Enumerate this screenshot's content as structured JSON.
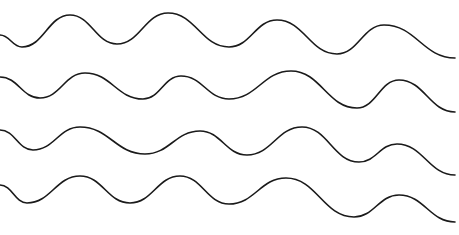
{
  "canvas": {
    "width": 459,
    "height": 235,
    "background": "#ffffff"
  },
  "style": {
    "stroke": "#1a1a1a",
    "stroke_width": 1.6
  },
  "waves": [
    {
      "name": "wave-line-1",
      "points": [
        [
          0,
          35
        ],
        [
          22,
          47
        ],
        [
          70,
          15
        ],
        [
          117,
          44
        ],
        [
          168,
          13
        ],
        [
          229,
          47
        ],
        [
          277,
          20
        ],
        [
          337,
          54
        ],
        [
          384,
          25
        ],
        [
          455,
          58
        ]
      ]
    },
    {
      "name": "wave-line-2",
      "points": [
        [
          0,
          77
        ],
        [
          40,
          98
        ],
        [
          85,
          73
        ],
        [
          143,
          99
        ],
        [
          181,
          76
        ],
        [
          229,
          99
        ],
        [
          291,
          71
        ],
        [
          357,
          108
        ],
        [
          399,
          80
        ],
        [
          455,
          112
        ]
      ]
    },
    {
      "name": "wave-line-3",
      "points": [
        [
          0,
          130
        ],
        [
          33,
          150
        ],
        [
          80,
          127
        ],
        [
          145,
          154
        ],
        [
          200,
          131
        ],
        [
          247,
          155
        ],
        [
          302,
          127
        ],
        [
          359,
          162
        ],
        [
          397,
          144
        ],
        [
          455,
          175
        ]
      ]
    },
    {
      "name": "wave-line-4",
      "points": [
        [
          0,
          185
        ],
        [
          27,
          203
        ],
        [
          80,
          176
        ],
        [
          130,
          203
        ],
        [
          180,
          176
        ],
        [
          229,
          204
        ],
        [
          286,
          178
        ],
        [
          354,
          217
        ],
        [
          399,
          195
        ],
        [
          455,
          222
        ]
      ]
    }
  ]
}
